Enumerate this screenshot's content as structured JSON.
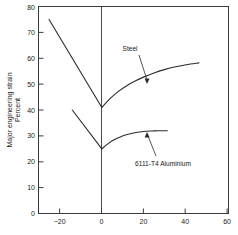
{
  "chart_data": {
    "type": "line",
    "title": "",
    "xlabel": "",
    "ylabel": "Major engineering strain\nPercent",
    "ylabel_line1": "Major engineering strain",
    "ylabel_line2": "Percent",
    "xlim": [
      -30,
      60
    ],
    "ylim": [
      0,
      80
    ],
    "xticks": [
      -20,
      0,
      20,
      40,
      60
    ],
    "xticklabels": [
      "−20",
      "0",
      "20",
      "40",
      "60"
    ],
    "yticks": [
      0,
      10,
      20,
      30,
      40,
      50,
      60,
      70,
      80
    ],
    "yticklabels": [
      "0",
      "10",
      "20",
      "30",
      "40",
      "50",
      "60",
      "70",
      "80"
    ],
    "grid": false,
    "legend": "none",
    "zero_axis_x": 0,
    "series": [
      {
        "name": "Steel",
        "label": "Steel",
        "annotation_x": 21,
        "annotation_y": 63,
        "left_branch": [
          {
            "x": -25,
            "y": 75
          },
          {
            "x": 0,
            "y": 41
          }
        ],
        "right_branch": [
          {
            "x": 0,
            "y": 41
          },
          {
            "x": 4,
            "y": 44.5
          },
          {
            "x": 8,
            "y": 47.3
          },
          {
            "x": 12,
            "y": 49.5
          },
          {
            "x": 16,
            "y": 51.3
          },
          {
            "x": 20,
            "y": 52.8
          },
          {
            "x": 25,
            "y": 54.4
          },
          {
            "x": 30,
            "y": 55.7
          },
          {
            "x": 35,
            "y": 56.7
          },
          {
            "x": 40,
            "y": 57.5
          },
          {
            "x": 46,
            "y": 58.2
          }
        ]
      },
      {
        "name": "6111-T4 Aluminium",
        "label": "6111-T4 Aluminium",
        "annotation_x": 22,
        "annotation_y": 14,
        "left_branch": [
          {
            "x": -14,
            "y": 40
          },
          {
            "x": 0,
            "y": 25
          }
        ],
        "right_branch": [
          {
            "x": 0,
            "y": 25
          },
          {
            "x": 3,
            "y": 27.0
          },
          {
            "x": 6,
            "y": 28.6
          },
          {
            "x": 9,
            "y": 29.7
          },
          {
            "x": 12,
            "y": 30.5
          },
          {
            "x": 15,
            "y": 31.1
          },
          {
            "x": 18,
            "y": 31.5
          },
          {
            "x": 21,
            "y": 31.8
          },
          {
            "x": 24,
            "y": 31.9
          },
          {
            "x": 27,
            "y": 32.0
          },
          {
            "x": 31,
            "y": 32.0
          }
        ]
      }
    ],
    "annotations": [
      {
        "text": "Steel",
        "text_x": 130,
        "text_y": 51,
        "leader_from": [
          139,
          55
        ],
        "leader_to": [
          147,
          83
        ]
      },
      {
        "text": "6111-T4 Aluminium",
        "text_x": 133,
        "text_y": 165,
        "leader_from": [
          155,
          158
        ],
        "leader_to": [
          147,
          133
        ]
      }
    ],
    "colors": {
      "curve": "#2b2b2b",
      "frame": "#3a3a3a",
      "text": "#1a1a1a",
      "background": "#ffffff"
    }
  }
}
